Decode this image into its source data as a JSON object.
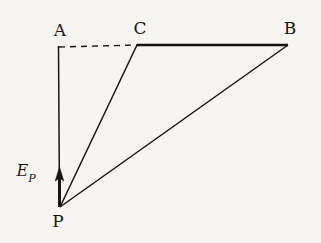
{
  "figure": {
    "background_color": "#f7f5f2",
    "ink_color": "#17150f",
    "width": 321,
    "height": 243,
    "caption": ""
  },
  "labels": {
    "a": "A",
    "c": "C",
    "b": "B",
    "p": "P",
    "field_symbol": "E",
    "field_subscript": "P"
  },
  "chart_data": {
    "type": "diagram",
    "title": "",
    "xlabel": "",
    "ylabel": "",
    "points": [
      {
        "name": "A",
        "x": 59,
        "y": 47,
        "label": "A",
        "label_x": 60,
        "label_y": 30
      },
      {
        "name": "C",
        "x": 137,
        "y": 45,
        "label": "C",
        "label_x": 140,
        "label_y": 28
      },
      {
        "name": "B",
        "x": 288,
        "y": 45,
        "label": "B",
        "label_x": 290,
        "label_y": 28
      },
      {
        "name": "P",
        "x": 60,
        "y": 207,
        "label": "P",
        "label_x": 58,
        "label_y": 220
      }
    ],
    "segments": [
      {
        "name": "A-C",
        "from": "A",
        "to": "C",
        "style": "dashed",
        "width": 1.3
      },
      {
        "name": "C-B",
        "from": "C",
        "to": "B",
        "style": "solid",
        "width": 2.4
      },
      {
        "name": "P-A",
        "from": "P",
        "to": "A",
        "style": "solid",
        "width": 1.3,
        "arrow": "toward-A"
      },
      {
        "name": "P-C",
        "from": "P",
        "to": "C",
        "style": "solid",
        "width": 1.3
      },
      {
        "name": "P-B",
        "from": "P",
        "to": "B",
        "style": "solid",
        "width": 1.3
      }
    ],
    "vectors": [
      {
        "name": "E_P",
        "label": "E_P",
        "origin": "P",
        "direction": "up",
        "tail_x": 60,
        "tail_y": 207,
        "tip_x": 60,
        "tip_y": 167,
        "label_x": 26,
        "label_y": 174
      }
    ]
  }
}
